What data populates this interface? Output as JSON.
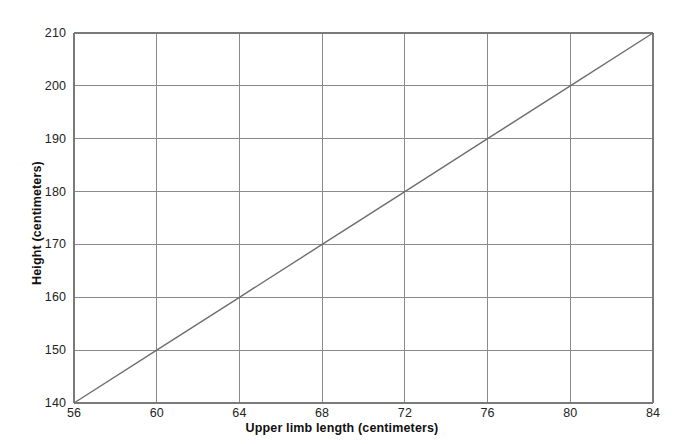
{
  "chart_data": {
    "type": "line",
    "title": "",
    "xlabel": "Upper limb length (centimeters)",
    "ylabel": "Height (centimeters)",
    "xlim": [
      56,
      84
    ],
    "ylim": [
      140,
      210
    ],
    "xticks": [
      56,
      60,
      64,
      68,
      72,
      76,
      80,
      84
    ],
    "yticks": [
      140,
      150,
      160,
      170,
      180,
      190,
      200,
      210
    ],
    "grid": true,
    "legend": "none",
    "series": [
      {
        "name": "height-vs-upper-limb-length",
        "x": [
          56,
          60,
          64,
          68,
          72,
          76,
          80,
          84
        ],
        "values": [
          140,
          150,
          160,
          170,
          180,
          190,
          200,
          210
        ],
        "color": "#6e6e6e"
      }
    ],
    "xtick_labels": [
      "56",
      "60",
      "64",
      "68",
      "72",
      "76",
      "80",
      "84"
    ],
    "ytick_labels": [
      "140",
      "150",
      "160",
      "170",
      "180",
      "190",
      "200",
      "210"
    ]
  },
  "style": {
    "background": "#ffffff",
    "axis_color": "#7a7a7a",
    "grid_color": "#8a8a8a",
    "line_color": "#6e6e6e",
    "text_color": "#1a1a1a"
  }
}
